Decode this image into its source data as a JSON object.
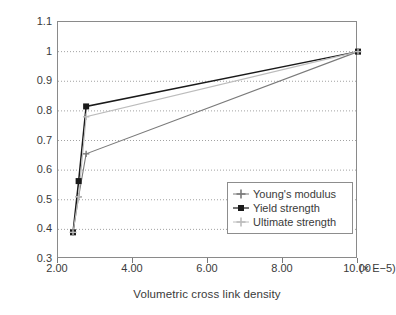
{
  "chart_data": {
    "type": "line",
    "title": "",
    "xlabel": "Volumetric cross link density",
    "ylabel": "Normalized mechanical parameters",
    "x_exponent_note": "(× E−5)",
    "xlim": [
      2.0,
      10.0
    ],
    "ylim": [
      0.3,
      1.1
    ],
    "xticks": [
      "2.00",
      "4.00",
      "6.00",
      "8.00",
      "10.00"
    ],
    "xtick_values": [
      2.0,
      4.0,
      6.0,
      8.0,
      10.0
    ],
    "yticks": [
      "0.3",
      "0.4",
      "0.5",
      "0.6",
      "0.7",
      "0.8",
      "0.9",
      "1",
      "1.1"
    ],
    "ytick_values": [
      0.3,
      0.4,
      0.5,
      0.6,
      0.7,
      0.8,
      0.9,
      1.0,
      1.1
    ],
    "grid": "horizontal-dotted",
    "legend_position": "lower-right-inside",
    "series": [
      {
        "name": "Young's modulus",
        "marker": "cross",
        "color": "#7a7a7a",
        "x": [
          2.4,
          2.55,
          2.75,
          10.0
        ],
        "y": [
          0.39,
          0.51,
          0.655,
          1.0
        ]
      },
      {
        "name": "Yield strength",
        "marker": "filled-square",
        "color": "#1a1a1a",
        "x": [
          2.4,
          2.55,
          2.75,
          10.0
        ],
        "y": [
          0.39,
          0.563,
          0.815,
          1.0
        ]
      },
      {
        "name": "Ultimate strength",
        "marker": "cross",
        "color": "#bcbcbc",
        "x": [
          2.4,
          2.55,
          2.75,
          10.0
        ],
        "y": [
          0.39,
          0.51,
          0.78,
          1.0
        ]
      }
    ]
  },
  "legend": {
    "items": [
      {
        "label": "Young's modulus"
      },
      {
        "label": "Yield strength"
      },
      {
        "label": "Ultimate strength"
      }
    ]
  },
  "colors": {
    "youngs_modulus": "#7a7a7a",
    "yield_strength": "#1a1a1a",
    "ultimate_strength": "#bcbcbc",
    "axis": "#8a8a8a",
    "grid": "#8a8a8a",
    "text": "#3a3a3a",
    "background": "#ffffff"
  }
}
